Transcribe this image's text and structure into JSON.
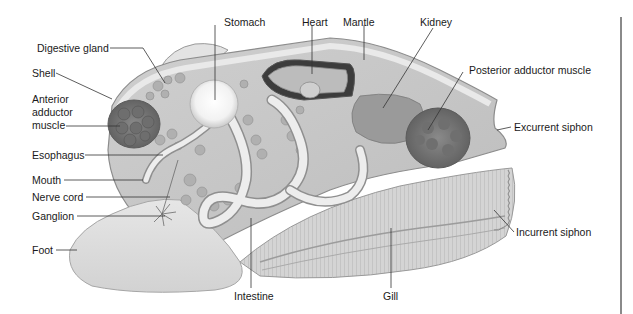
{
  "figure": {
    "labels": [
      {
        "id": "stomach",
        "text": "Stomach",
        "x": 224,
        "y": 16
      },
      {
        "id": "heart",
        "text": "Heart",
        "x": 302,
        "y": 16
      },
      {
        "id": "mantle",
        "text": "Mantle",
        "x": 343,
        "y": 16
      },
      {
        "id": "kidney",
        "text": "Kidney",
        "x": 420,
        "y": 16
      },
      {
        "id": "digestive-gland",
        "text": "Digestive gland",
        "x": 37,
        "y": 42
      },
      {
        "id": "shell",
        "text": "Shell",
        "x": 32,
        "y": 67
      },
      {
        "id": "posterior-adductor-muscle",
        "text": "Posterior adductor muscle",
        "x": 469,
        "y": 64
      },
      {
        "id": "anterior-adductor-muscle",
        "text": "Anterior\nadductor\nmuscle",
        "x": 32,
        "y": 93
      },
      {
        "id": "excurrent-siphon",
        "text": "Excurrent siphon",
        "x": 514,
        "y": 121
      },
      {
        "id": "esophagus",
        "text": "Esophagus",
        "x": 32,
        "y": 151
      },
      {
        "id": "mouth",
        "text": "Mouth",
        "x": 32,
        "y": 174
      },
      {
        "id": "nerve-cord",
        "text": "Nerve cord",
        "x": 32,
        "y": 192
      },
      {
        "id": "ganglion",
        "text": "Ganglion",
        "x": 32,
        "y": 210
      },
      {
        "id": "incurrent-siphon",
        "text": "Incurrent siphon",
        "x": 516,
        "y": 226
      },
      {
        "id": "foot",
        "text": "Foot",
        "x": 32,
        "y": 243
      },
      {
        "id": "intestine",
        "text": "Intestine",
        "x": 234,
        "y": 289
      },
      {
        "id": "gill",
        "text": "Gill",
        "x": 383,
        "y": 289
      }
    ],
    "colors": {
      "shell": "#d9d9d9",
      "outline": "#8c8c8c",
      "organ_dark": "#7a7a7a",
      "organ_mid": "#a8a8a8",
      "organ_light": "#f0f0f0",
      "leader": "#333333",
      "divider": "#8a8a8a"
    }
  }
}
